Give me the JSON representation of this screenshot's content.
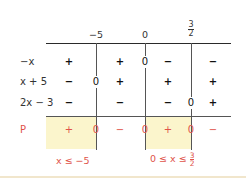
{
  "colors": {
    "accent": "#e0534a",
    "shade": "#fbf5cc",
    "line": "#2a2a2a"
  },
  "header": {
    "critical_points": [
      {
        "label": "−5"
      },
      {
        "label": "0"
      },
      {
        "label_num": "3",
        "label_den": "2"
      }
    ]
  },
  "rows": [
    {
      "label": "−x",
      "signs": [
        "+",
        "+",
        "−",
        "−"
      ],
      "zeros": [
        "",
        "0",
        ""
      ]
    },
    {
      "label": "x + 5",
      "signs": [
        "−",
        "+",
        "+",
        "+"
      ],
      "zeros": [
        "0",
        "",
        ""
      ]
    },
    {
      "label": "2x − 3",
      "signs": [
        "−",
        "−",
        "−",
        "+"
      ],
      "zeros": [
        "",
        "",
        "0"
      ]
    }
  ],
  "result": {
    "label": "P",
    "signs": [
      "+",
      "−",
      "+",
      "−"
    ],
    "zeros": [
      "0",
      "0",
      "0"
    ]
  },
  "solutions": [
    {
      "text": "x ≤ −5"
    },
    {
      "text": "0 ≤ x ≤ ",
      "frac_num": "3",
      "frac_den": "2"
    }
  ]
}
